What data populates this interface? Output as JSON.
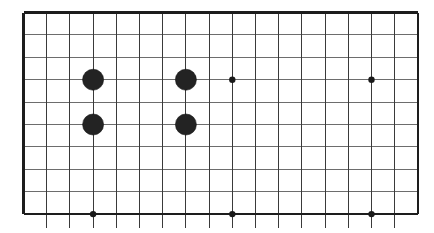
{
  "diagram": {
    "kind": "go-board-diagram",
    "board_region_label": "partial go board, lower section",
    "colors": {
      "background": "#ffffff",
      "grid_line": "#3a3a3a",
      "grid_line_faint": "#6d6d6d",
      "border_line": "#1d1d1d",
      "stone_black": "#232323",
      "star_point": "#1a1a1a"
    },
    "geometry": {
      "origin_x": 23.5,
      "origin_y": 12.5,
      "col_spacing": 23.2,
      "row_spacing": 22.4,
      "columns": 18,
      "rows": 10,
      "stone_radius": 10.5,
      "star_radius": 3.2,
      "line_overshoot_bottom": 14
    },
    "stones": [
      {
        "label": "black-stone-1",
        "color": "black",
        "col": 3,
        "row": 3
      },
      {
        "label": "black-stone-2",
        "color": "black",
        "col": 7,
        "row": 3
      },
      {
        "label": "black-stone-3",
        "color": "black",
        "col": 3,
        "row": 5
      },
      {
        "label": "black-stone-4",
        "color": "black",
        "col": 7,
        "row": 5
      }
    ],
    "star_points": [
      {
        "label": "star-point-1",
        "col": 9,
        "row": 3
      },
      {
        "label": "star-point-2",
        "col": 15,
        "row": 3
      },
      {
        "label": "star-point-3",
        "col": 3,
        "row": 9
      },
      {
        "label": "star-point-4",
        "col": 9,
        "row": 9
      },
      {
        "label": "star-point-5",
        "col": 15,
        "row": 9
      }
    ],
    "counts": {
      "black_stones": 4,
      "white_stones": 0,
      "star_points": 5
    }
  }
}
